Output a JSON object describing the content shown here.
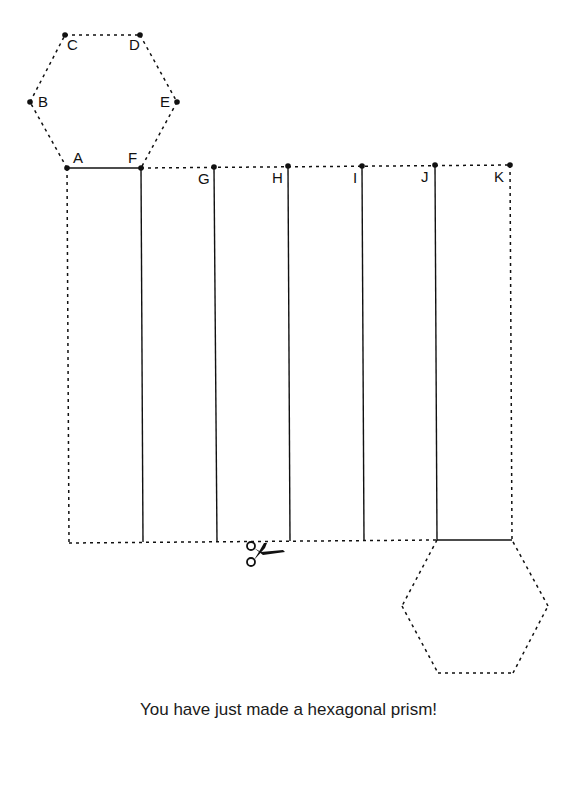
{
  "diagram": {
    "vertex_labels": {
      "A": "A",
      "B": "B",
      "C": "C",
      "D": "D",
      "E": "E",
      "F": "F",
      "G": "G",
      "H": "H",
      "I": "I",
      "J": "J",
      "K": "K"
    },
    "cut_icon": "scissors-icon",
    "line_color": "#111111"
  },
  "caption": "You have just made a hexagonal prism!"
}
